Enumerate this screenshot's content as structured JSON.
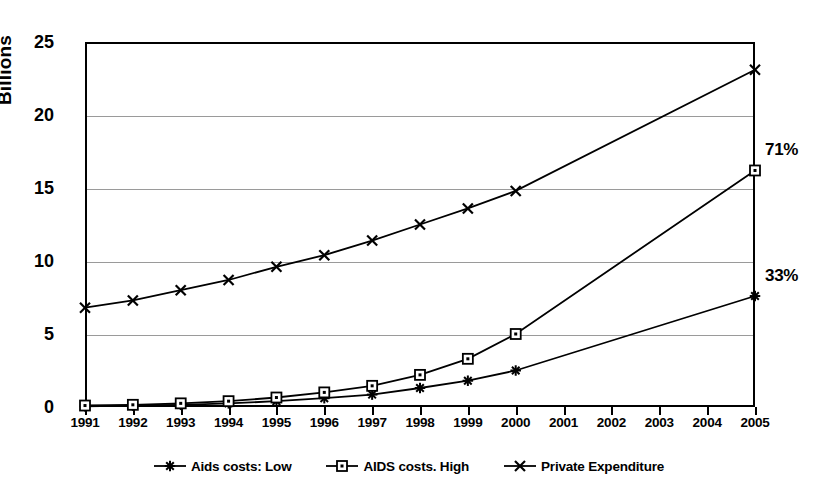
{
  "chart_data": {
    "type": "line",
    "title": "",
    "subtitle": "",
    "xlabel": "",
    "ylabel": "Billions",
    "categories": [
      "1991",
      "1992",
      "1993",
      "1994",
      "1995",
      "1996",
      "1997",
      "1998",
      "1999",
      "2000",
      "2001",
      "2002",
      "2003",
      "2004",
      "2005"
    ],
    "ylim": [
      0,
      25
    ],
    "yticks": [
      0,
      5,
      10,
      15,
      20,
      25
    ],
    "grid": true,
    "legend_position": "bottom",
    "series": [
      {
        "name": "Aids costs: Low",
        "marker": "asterisk",
        "values": [
          0.05,
          0.1,
          0.15,
          0.25,
          0.4,
          0.6,
          0.85,
          1.3,
          1.8,
          2.5,
          null,
          null,
          null,
          null,
          7.6
        ],
        "end_label": "33%"
      },
      {
        "name": "AIDS costs. High",
        "marker": "square",
        "values": [
          0.1,
          0.15,
          0.25,
          0.4,
          0.65,
          1.0,
          1.45,
          2.2,
          3.3,
          5.0,
          null,
          null,
          null,
          null,
          16.2
        ],
        "end_label": "71%"
      },
      {
        "name": "Private Expenditure",
        "marker": "x",
        "values": [
          6.8,
          7.3,
          8.0,
          8.7,
          9.6,
          10.4,
          11.4,
          12.5,
          13.6,
          14.8,
          null,
          null,
          null,
          null,
          23.1
        ],
        "end_label": ""
      }
    ],
    "annotations": [
      {
        "text": "71%",
        "series": "AIDS costs. High",
        "x": "2005"
      },
      {
        "text": "33%",
        "series": "Aids costs: Low",
        "x": "2005"
      }
    ],
    "colors": {
      "line": "#000000",
      "grid": "#9a9a9a",
      "axis": "#000000",
      "background": "#ffffff"
    }
  },
  "legend": {
    "items": [
      {
        "label": "Aids costs: Low",
        "marker": "asterisk"
      },
      {
        "label": "AIDS costs. High",
        "marker": "square"
      },
      {
        "label": "Private Expenditure",
        "marker": "x"
      }
    ]
  }
}
